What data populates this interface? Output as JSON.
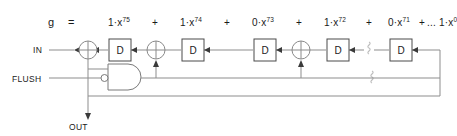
{
  "equation": {
    "lhs": "g",
    "equals": "=",
    "terms": [
      {
        "coeff": "1",
        "dot": "·",
        "base": "x",
        "exp": "75"
      },
      {
        "coeff": "1",
        "dot": "·",
        "base": "x",
        "exp": "74"
      },
      {
        "coeff": "0",
        "dot": "·",
        "base": "x",
        "exp": "73"
      },
      {
        "coeff": "1",
        "dot": "·",
        "base": "x",
        "exp": "72"
      },
      {
        "coeff": "0",
        "dot": "·",
        "base": "x",
        "exp": "71"
      },
      {
        "coeff": "1",
        "dot": "·",
        "base": "x",
        "exp": "0"
      }
    ],
    "plus": "+",
    "ellipsis": "..."
  },
  "ports": {
    "input": "IN",
    "flush": "FLUSH",
    "output": "OUT"
  },
  "registers": {
    "label": "D",
    "count": 5
  },
  "colors": {
    "background": "#ffffff",
    "wire": "#8d8d8d",
    "gate_outline": "#4a4a4a",
    "text": "#1a1a1a",
    "break_symbol": "#bdbdbd"
  }
}
